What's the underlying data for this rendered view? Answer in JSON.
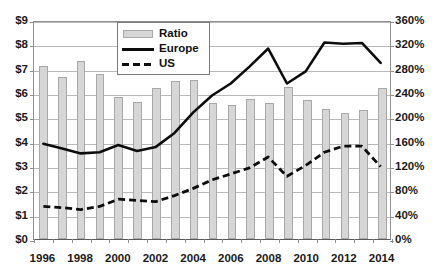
{
  "chart_data": {
    "type": "bar",
    "title": "",
    "subtitle": "",
    "xlabel": "",
    "ylabel": "",
    "y2label": "",
    "grid": true,
    "legend_position": "top-left-inside",
    "categories": [
      "1996",
      "1997",
      "1998",
      "1999",
      "2000",
      "2001",
      "2002",
      "2003",
      "2004",
      "2005",
      "2006",
      "2007",
      "2008",
      "2009",
      "2010",
      "2011",
      "2012",
      "2013",
      "2014"
    ],
    "x_tick_labels": [
      "1996",
      "1998",
      "2000",
      "2002",
      "2004",
      "2006",
      "2008",
      "2010",
      "2012",
      "2014"
    ],
    "y_left_tick_labels": [
      "$0",
      "$1",
      "$2",
      "$3",
      "$4",
      "$5",
      "$6",
      "$7",
      "$8",
      "$9"
    ],
    "y_right_tick_labels": [
      "0%",
      "40%",
      "80%",
      "120%",
      "160%",
      "200%",
      "240%",
      "280%",
      "320%",
      "360%"
    ],
    "ylim": [
      0,
      9
    ],
    "y2lim": [
      0,
      360
    ],
    "y_tick_step": 1,
    "y2_tick_step": 40,
    "series": [
      {
        "name": "Ratio",
        "type": "bar",
        "axis": "right",
        "unit": "%",
        "color": "#d6d6d6",
        "edge_color": "#a8a8a8",
        "values": [
          285,
          267,
          293,
          272,
          234,
          225,
          249,
          260,
          261,
          223,
          221,
          230,
          223,
          250,
          229,
          214,
          207,
          212,
          249
        ]
      },
      {
        "name": "Europe",
        "type": "line",
        "axis": "left",
        "unit": "$",
        "color": "#0d0d0d",
        "style": "solid",
        "values": [
          3.95,
          3.75,
          3.55,
          3.6,
          3.9,
          3.65,
          3.82,
          4.4,
          5.25,
          5.95,
          6.45,
          7.15,
          7.9,
          6.45,
          6.95,
          8.15,
          8.1,
          8.13,
          7.3
        ]
      },
      {
        "name": "US",
        "type": "line",
        "axis": "left",
        "unit": "$",
        "color": "#0d0d0d",
        "style": "dashed",
        "values": [
          1.35,
          1.3,
          1.22,
          1.35,
          1.65,
          1.6,
          1.55,
          1.8,
          2.1,
          2.45,
          2.7,
          2.95,
          3.4,
          2.6,
          3.05,
          3.6,
          3.85,
          3.85,
          3.0
        ]
      }
    ]
  },
  "legend": {
    "items": [
      {
        "label": "Ratio",
        "key": "bar-swatch"
      },
      {
        "label": "Europe",
        "key": "solid-line-swatch"
      },
      {
        "label": "US",
        "key": "dashed-line-swatch"
      }
    ]
  },
  "colors": {
    "bar_fill": "#d6d6d6",
    "bar_edge": "#a8a8a8",
    "line": "#0d0d0d",
    "gridline": "#b9b9b9",
    "axis": "#8f8f8f",
    "text": "#1a1a1a",
    "background": "#ffffff"
  }
}
